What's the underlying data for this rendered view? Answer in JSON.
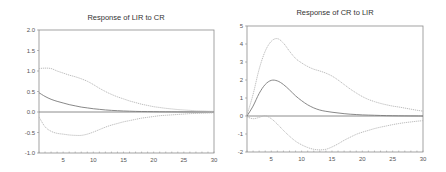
{
  "colors": {
    "frame": "#8c8c8c",
    "zero_line": "#6e6e6e",
    "response": "#7a7a7a",
    "band": "#b4b4b4",
    "text": "#333333"
  },
  "chart_data": [
    {
      "type": "line",
      "title": "Response of LIR to CR",
      "xlabel": "",
      "ylabel": "",
      "xlim": [
        1,
        30
      ],
      "ylim": [
        -1.0,
        2.0
      ],
      "xticks": [
        5,
        10,
        15,
        20,
        25,
        30
      ],
      "yticks": [
        "2.0",
        "1.5",
        "1.0",
        "0.5",
        "0.0",
        "-0.5",
        "-1.0"
      ],
      "ytick_values": [
        2.0,
        1.5,
        1.0,
        0.5,
        0.0,
        -0.5,
        -1.0
      ],
      "grid": false,
      "legend": null,
      "x": [
        1,
        2,
        3,
        4,
        5,
        6,
        7,
        8,
        9,
        10,
        11,
        12,
        13,
        14,
        15,
        16,
        17,
        18,
        19,
        20,
        21,
        22,
        23,
        24,
        25,
        26,
        27,
        28,
        29,
        30
      ],
      "series": [
        {
          "name": "Response",
          "style": "solid",
          "values": [
            0.47,
            0.38,
            0.31,
            0.26,
            0.22,
            0.18,
            0.15,
            0.12,
            0.1,
            0.08,
            0.065,
            0.05,
            0.04,
            0.032,
            0.025,
            0.02,
            0.015,
            0.012,
            0.01,
            0.008,
            0.006,
            0.005,
            0.004,
            0.003,
            0.002,
            0.002,
            0.001,
            0.001,
            0.001,
            0.0
          ]
        },
        {
          "name": "Upper band (+2 S.E.)",
          "style": "dotted",
          "values": [
            1.06,
            1.07,
            1.06,
            1.0,
            0.95,
            0.9,
            0.86,
            0.81,
            0.75,
            0.67,
            0.58,
            0.5,
            0.43,
            0.37,
            0.32,
            0.27,
            0.23,
            0.19,
            0.16,
            0.13,
            0.11,
            0.09,
            0.075,
            0.06,
            0.05,
            0.04,
            0.03,
            0.025,
            0.02,
            0.015
          ]
        },
        {
          "name": "Lower band (-2 S.E.)",
          "style": "dotted",
          "values": [
            -0.12,
            -0.36,
            -0.47,
            -0.52,
            -0.54,
            -0.56,
            -0.57,
            -0.57,
            -0.54,
            -0.49,
            -0.43,
            -0.37,
            -0.32,
            -0.28,
            -0.24,
            -0.21,
            -0.18,
            -0.15,
            -0.13,
            -0.11,
            -0.09,
            -0.08,
            -0.07,
            -0.06,
            -0.05,
            -0.04,
            -0.035,
            -0.03,
            -0.025,
            -0.02
          ]
        }
      ]
    },
    {
      "type": "line",
      "title": "Response of CR to LIR",
      "xlabel": "",
      "ylabel": "",
      "xlim": [
        1,
        30
      ],
      "ylim": [
        -2,
        5
      ],
      "xticks": [
        5,
        10,
        15,
        20,
        25,
        30
      ],
      "yticks": [
        "5",
        "4",
        "3",
        "2",
        "1",
        "0",
        "-1",
        "-2"
      ],
      "ytick_values": [
        5,
        4,
        3,
        2,
        1,
        0,
        -1,
        -2
      ],
      "grid": false,
      "legend": null,
      "x": [
        1,
        2,
        3,
        4,
        5,
        6,
        7,
        8,
        9,
        10,
        11,
        12,
        13,
        14,
        15,
        16,
        17,
        18,
        19,
        20,
        21,
        22,
        23,
        24,
        25,
        26,
        27,
        28,
        29,
        30
      ],
      "series": [
        {
          "name": "Response",
          "style": "solid",
          "values": [
            0.0,
            0.55,
            1.25,
            1.75,
            1.98,
            1.95,
            1.75,
            1.45,
            1.12,
            0.85,
            0.62,
            0.45,
            0.33,
            0.26,
            0.21,
            0.17,
            0.13,
            0.1,
            0.08,
            0.06,
            0.05,
            0.04,
            0.03,
            0.02,
            0.015,
            0.01,
            0.008,
            0.005,
            0.003,
            0.0
          ]
        },
        {
          "name": "Upper band (+2 S.E.)",
          "style": "dotted",
          "values": [
            0.05,
            1.2,
            2.6,
            3.6,
            4.15,
            4.3,
            4.05,
            3.6,
            3.2,
            2.95,
            2.75,
            2.6,
            2.5,
            2.38,
            2.22,
            2.0,
            1.75,
            1.5,
            1.28,
            1.08,
            0.92,
            0.8,
            0.7,
            0.62,
            0.55,
            0.5,
            0.44,
            0.38,
            0.32,
            0.27
          ]
        },
        {
          "name": "Lower band (-2 S.E.)",
          "style": "dotted",
          "values": [
            -0.05,
            -0.15,
            -0.08,
            0.02,
            -0.15,
            -0.45,
            -0.8,
            -1.12,
            -1.4,
            -1.6,
            -1.75,
            -1.85,
            -1.88,
            -1.85,
            -1.72,
            -1.55,
            -1.35,
            -1.18,
            -1.02,
            -0.9,
            -0.8,
            -0.7,
            -0.62,
            -0.55,
            -0.48,
            -0.42,
            -0.37,
            -0.33,
            -0.29,
            -0.26
          ]
        }
      ]
    }
  ],
  "panels": [
    {
      "frame": {
        "x": 39,
        "y": 30,
        "w": 175,
        "h": 123
      },
      "title_y": 17
    },
    {
      "frame": {
        "x": 247,
        "y": 26,
        "w": 176,
        "h": 126
      },
      "title_y": 12
    }
  ]
}
